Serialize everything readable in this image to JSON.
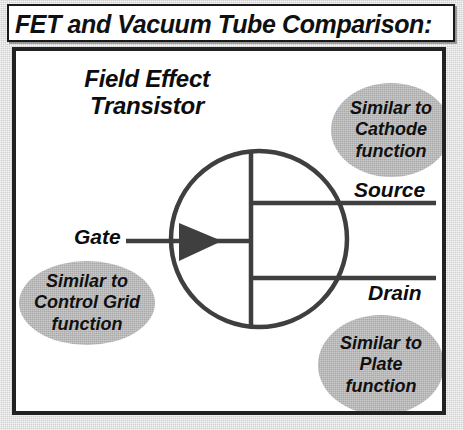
{
  "title": {
    "text": "FET and Vacuum Tube Comparison:"
  },
  "diagram": {
    "device_label": "Field Effect Transistor",
    "terminals": {
      "gate": "Gate",
      "source": "Source",
      "drain": "Drain"
    },
    "callouts": [
      {
        "id": "cathode",
        "text": "Similar to Cathode function",
        "relates_to": "Source",
        "fill": "#aaaaaa"
      },
      {
        "id": "control-grid",
        "text": "Similar to Control Grid function",
        "relates_to": "Gate",
        "fill": "#aaaaaa"
      },
      {
        "id": "plate",
        "text": "Similar to Plate function",
        "relates_to": "Drain",
        "fill": "#aaaaaa"
      }
    ],
    "symbol": {
      "name": "n-channel-jfet-symbol",
      "stroke": "#3f3f3f",
      "envelope": "circle",
      "gate_arrow_direction": "right"
    }
  },
  "colors": {
    "ink": "#1a1a1a",
    "paper": "#ffffff",
    "page_background": "#cfcfcf",
    "bubble_fill": "#aaaaaa",
    "symbol_stroke": "#3f3f3f"
  }
}
